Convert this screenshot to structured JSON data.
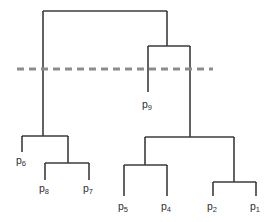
{
  "figure": {
    "kind": "dendrogram",
    "width": 275,
    "height": 222,
    "background_color": "#ffffff",
    "line_color": "#3b3b40",
    "cut_line_color": "#8c8c8c",
    "label_color": "#2f2f33"
  },
  "leaves": [
    {
      "id": "p6",
      "base": "p",
      "sub": "6",
      "x": 22,
      "label_x": 16,
      "label_y": 155
    },
    {
      "id": "p8",
      "base": "p",
      "sub": "8",
      "x": 45,
      "label_x": 39,
      "label_y": 183
    },
    {
      "id": "p7",
      "base": "p",
      "sub": "7",
      "x": 89,
      "label_x": 83,
      "label_y": 183
    },
    {
      "id": "p9",
      "base": "p",
      "sub": "9",
      "x": 148,
      "label_x": 142,
      "label_y": 99
    },
    {
      "id": "p5",
      "base": "p",
      "sub": "5",
      "x": 124,
      "label_x": 118,
      "label_y": 201
    },
    {
      "id": "p4",
      "base": "p",
      "sub": "4",
      "x": 167,
      "label_x": 161,
      "label_y": 201
    },
    {
      "id": "p2",
      "base": "p",
      "sub": "2",
      "x": 213,
      "label_x": 207,
      "label_y": 201
    },
    {
      "id": "p1",
      "base": "p",
      "sub": "1",
      "x": 256,
      "label_x": 250,
      "label_y": 201
    }
  ],
  "merges": [
    {
      "id": "root",
      "y": 11,
      "left_x": 43,
      "right_x": 167
    },
    {
      "id": "right-top",
      "y": 46,
      "left_x": 148,
      "right_x": 190
    },
    {
      "id": "left-cluster",
      "y": 136,
      "left_x": 22,
      "right_x": 68
    },
    {
      "id": "p8-p7-cluster",
      "y": 163,
      "left_x": 45,
      "right_x": 89
    },
    {
      "id": "right-cluster",
      "y": 137,
      "left_x": 145,
      "right_x": 234
    },
    {
      "id": "p5-p4-cluster",
      "y": 165,
      "left_x": 124,
      "right_x": 167
    },
    {
      "id": "p2-p1-cluster",
      "y": 182,
      "left_x": 213,
      "right_x": 256
    }
  ],
  "stems": [
    {
      "id": "root-left-stem",
      "x": 43,
      "y1": 11,
      "y2": 136
    },
    {
      "id": "root-right-stem",
      "x": 167,
      "y1": 11,
      "y2": 46
    },
    {
      "id": "p9-stem",
      "x": 148,
      "y1": 46,
      "y2": 92
    },
    {
      "id": "right-top-right-stem",
      "x": 190,
      "y1": 46,
      "y2": 137
    },
    {
      "id": "p6-stem",
      "x": 22,
      "y1": 136,
      "y2": 152
    },
    {
      "id": "p8p7-parent-stem",
      "x": 68,
      "y1": 136,
      "y2": 163
    },
    {
      "id": "p8-stem",
      "x": 45,
      "y1": 163,
      "y2": 180
    },
    {
      "id": "p7-stem",
      "x": 89,
      "y1": 163,
      "y2": 180
    },
    {
      "id": "p5p4-parent-stem",
      "x": 145,
      "y1": 137,
      "y2": 165
    },
    {
      "id": "p2p1-parent-stem",
      "x": 234,
      "y1": 137,
      "y2": 182
    },
    {
      "id": "p5-stem",
      "x": 124,
      "y1": 165,
      "y2": 196
    },
    {
      "id": "p4-stem",
      "x": 167,
      "y1": 165,
      "y2": 196
    },
    {
      "id": "p2-stem",
      "x": 213,
      "y1": 182,
      "y2": 196
    },
    {
      "id": "p1-stem",
      "x": 256,
      "y1": 182,
      "y2": 196
    }
  ],
  "cut_line": {
    "id": "cut-threshold-line",
    "y": 69,
    "x1": 17,
    "x2": 213,
    "style": "dashed"
  }
}
